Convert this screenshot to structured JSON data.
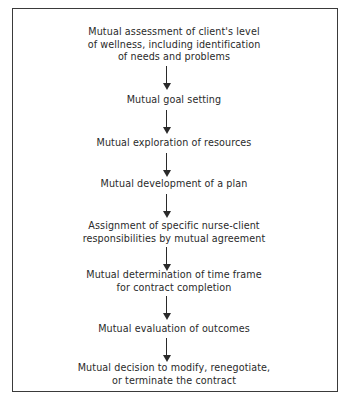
{
  "diagram": {
    "type": "flowchart",
    "direction": "top-to-bottom",
    "steps": [
      {
        "lines": [
          "Mutual assessment of client's level",
          "of wellness, including identification",
          "of needs and problems"
        ]
      },
      {
        "lines": [
          "Mutual goal setting"
        ]
      },
      {
        "lines": [
          "Mutual exploration of resources"
        ]
      },
      {
        "lines": [
          "Mutual development of a plan"
        ]
      },
      {
        "lines": [
          "Assignment of specific nurse-client",
          "responsibilities by mutual agreement"
        ]
      },
      {
        "lines": [
          "Mutual determination of time frame",
          "for contract completion"
        ]
      },
      {
        "lines": [
          "Mutual evaluation of outcomes"
        ]
      },
      {
        "lines": [
          "Mutual decision to modify, renegotiate,",
          "or terminate the contract"
        ]
      }
    ],
    "arrow_icon": "down-arrow-icon",
    "colors": {
      "text": "#2a2a2a",
      "border": "#3a3a3a",
      "background": "#ffffff"
    }
  }
}
